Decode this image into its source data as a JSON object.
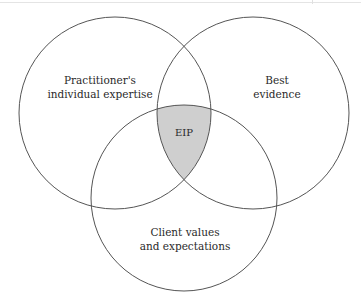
{
  "diagram": {
    "type": "venn",
    "sets": [
      {
        "id": "left",
        "label_lines": [
          "Practitioner's",
          "individual expertise"
        ]
      },
      {
        "id": "right",
        "label_lines": [
          "Best",
          "evidence"
        ]
      },
      {
        "id": "bottom",
        "label_lines": [
          "Client values",
          "and expectations"
        ]
      }
    ],
    "intersection": {
      "label": "EIP",
      "fill": "#cfcfcf"
    },
    "colors": {
      "stroke": "#555555",
      "background": "#ffffff"
    }
  }
}
